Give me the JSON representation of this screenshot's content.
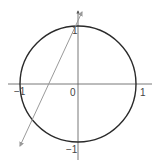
{
  "diagram": {
    "type": "unit-circle-with-line",
    "colors": {
      "background": "#ffffff",
      "circle": "#2a2a2a",
      "axes": "#555555",
      "line": "#9a9a9a",
      "labels": "#444444"
    },
    "labels": {
      "x_neg_one": "−1",
      "origin": "0",
      "x_pos_one": "1",
      "y_pos_one": "1",
      "y_neg_one": "−1"
    },
    "circle": {
      "center": [
        0,
        0
      ],
      "radius": 1
    },
    "axes": {
      "x_range": [
        -1.2,
        1.2
      ],
      "y_range": [
        -1.3,
        1.3
      ]
    },
    "line": {
      "description": "line passing near (0, 1) and crossing circle in third quadrant",
      "arrow_ends": 2
    }
  }
}
